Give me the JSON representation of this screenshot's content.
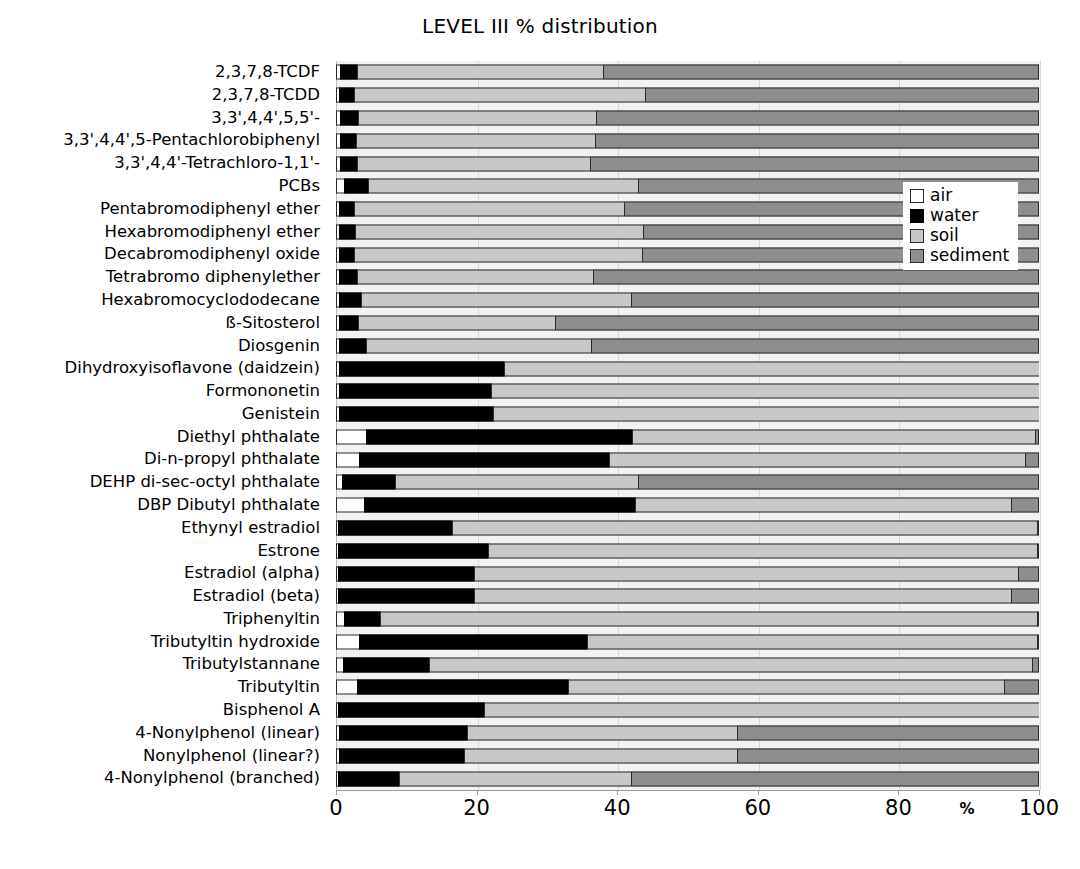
{
  "chart_data": {
    "type": "bar",
    "subtype": "horizontal-stacked-100",
    "title": "LEVEL III % distribution",
    "xlabel": "%",
    "ylabel": "",
    "xlim": [
      0,
      100
    ],
    "xticks": [
      0,
      20,
      40,
      60,
      80,
      100
    ],
    "xticklabels": [
      "0",
      "20",
      "40",
      "60",
      "80",
      "100"
    ],
    "grid": true,
    "legend_position": "inside-right-top",
    "legend": [
      "air",
      "water",
      "soil",
      "sediment"
    ],
    "colors": {
      "air": "#ffffff",
      "water": "#000000",
      "soil": "#c8c8c8",
      "sediment": "#8e8e8e",
      "plot_background": "#f2f2f2",
      "outline": "#2b2b2b"
    },
    "categories": [
      "2,3,7,8-TCDF",
      "2,3,7,8-TCDD",
      "3,3',4,4',5,5'-",
      "3,3',4,4',5-Pentachlorobiphenyl",
      "3,3',4,4'-Tetrachloro-1,1'-",
      "PCBs",
      "Pentabromodiphenyl ether",
      "Hexabromodiphenyl ether",
      "Decabromodiphenyl oxide",
      "Tetrabromo diphenylether",
      "Hexabromocyclododecane",
      "ß-Sitosterol",
      "Diosgenin",
      "Dihydroxyisoflavone (daidzein)",
      "Formononetin",
      "Genistein",
      "Diethyl phthalate",
      "Di-n-propyl phthalate",
      "DEHP di-sec-octyl phthalate",
      "DBP Dibutyl phthalate",
      "Ethynyl estradiol",
      "Estrone",
      "Estradiol  (alpha)",
      "Estradiol  (beta)",
      "Triphenyltin",
      "Tributyltin hydroxide",
      "Tributylstannane",
      "Tributyltin",
      "Bisphenol A",
      "4-Nonylphenol (linear)",
      "Nonylphenol (linear?)",
      "4-Nonylphenol (branched)"
    ],
    "series": [
      {
        "name": "air",
        "values": [
          0.6,
          0.4,
          0.6,
          0.5,
          0.6,
          1.2,
          0.4,
          0.4,
          0.4,
          0.4,
          0.4,
          0.4,
          0.4,
          0.4,
          0.4,
          0.4,
          4.3,
          3.3,
          0.8,
          4.0,
          0.3,
          0.3,
          0.3,
          0.3,
          1.2,
          3.3,
          1.0,
          3.0,
          0.3,
          0.4,
          0.4,
          0.3
        ]
      },
      {
        "name": "water",
        "values": [
          2.4,
          2.1,
          2.6,
          2.3,
          2.4,
          3.3,
          2.2,
          2.3,
          2.2,
          2.6,
          3.2,
          2.8,
          3.9,
          23.5,
          21.7,
          22.0,
          37.8,
          35.5,
          7.6,
          38.6,
          16.2,
          21.3,
          19.4,
          19.4,
          5.0,
          32.5,
          12.2,
          30.0,
          20.7,
          18.2,
          17.8,
          8.6
        ]
      },
      {
        "name": "soil",
        "values": [
          35.0,
          41.5,
          33.8,
          34.0,
          33.2,
          38.5,
          38.4,
          41.0,
          41.0,
          33.6,
          38.4,
          28.0,
          32.0,
          76.1,
          78.0,
          77.6,
          57.4,
          59.2,
          34.6,
          53.4,
          83.2,
          78.1,
          77.3,
          76.3,
          93.5,
          64.0,
          85.8,
          62.0,
          79.0,
          38.4,
          38.8,
          33.1
        ]
      },
      {
        "name": "sediment",
        "values": [
          62.0,
          56.0,
          63.0,
          63.2,
          63.8,
          57.0,
          59.0,
          56.3,
          56.4,
          63.4,
          58.0,
          68.8,
          63.7,
          0.0,
          0.0,
          0.0,
          0.5,
          2.0,
          57.0,
          4.0,
          0.3,
          0.3,
          3.0,
          4.0,
          0.3,
          0.2,
          1.0,
          5.0,
          0.0,
          43.0,
          43.0,
          58.0
        ]
      }
    ]
  },
  "xaxis": {
    "unit": "%"
  }
}
